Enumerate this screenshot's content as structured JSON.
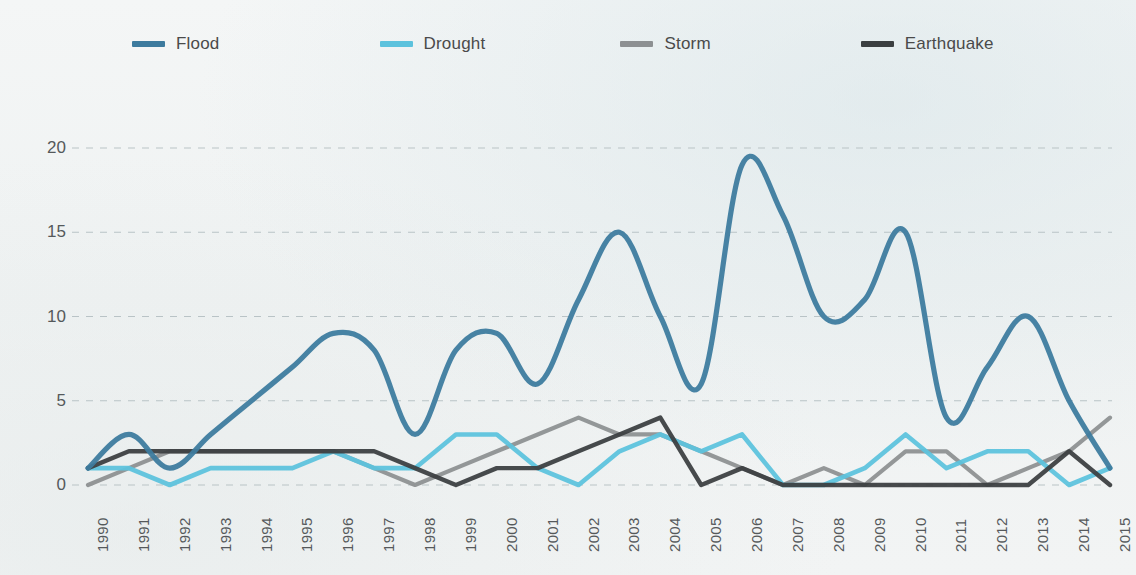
{
  "legend": {
    "position": "top-left",
    "items": [
      {
        "label": "Flood",
        "color": "#3d7b9e",
        "icon": "line-swatch"
      },
      {
        "label": "Drought",
        "color": "#5cc2dd",
        "icon": "line-swatch"
      },
      {
        "label": "Storm",
        "color": "#8d9092",
        "icon": "line-swatch"
      },
      {
        "label": "Earthquake",
        "color": "#3b3f41",
        "icon": "line-swatch"
      }
    ]
  },
  "axes": {
    "y_ticks": [
      "0",
      "5",
      "10",
      "15",
      "20"
    ],
    "x_ticks": [
      "1990",
      "1991",
      "1992",
      "1993",
      "1994",
      "1995",
      "1996",
      "1997",
      "1998",
      "1999",
      "2000",
      "2001",
      "2002",
      "2003",
      "2004",
      "2005",
      "2006",
      "2007",
      "2008",
      "2009",
      "2010",
      "2011",
      "2012",
      "2013",
      "2014",
      "2015"
    ]
  },
  "style": {
    "background": "#f1f4f4",
    "gridline_color": "#b9c3c6",
    "tick_text_color": "#55595b"
  },
  "chart_data": {
    "type": "line",
    "title": "",
    "subtitle": "",
    "xlabel": "",
    "ylabel": "",
    "xlim": [
      1990,
      2015
    ],
    "ylim": [
      0,
      21
    ],
    "y_ticks": [
      0,
      5,
      10,
      15,
      20
    ],
    "grid": "horizontal-dashed",
    "legend_position": "top-left",
    "smoothing": "spline",
    "x": [
      1990,
      1991,
      1992,
      1993,
      1994,
      1995,
      1996,
      1997,
      1998,
      1999,
      2000,
      2001,
      2002,
      2003,
      2004,
      2005,
      2006,
      2007,
      2008,
      2009,
      2010,
      2011,
      2012,
      2013,
      2014,
      2015
    ],
    "series": [
      {
        "name": "Flood",
        "color": "#3d7b9e",
        "values": [
          1,
          3,
          1,
          3,
          5,
          7,
          9,
          8,
          3,
          8,
          9,
          6,
          11,
          15,
          10,
          6,
          19,
          16,
          10,
          11,
          15,
          4,
          7,
          10,
          5,
          1
        ]
      },
      {
        "name": "Drought",
        "color": "#5cc2dd",
        "values": [
          1,
          1,
          0,
          1,
          1,
          1,
          2,
          1,
          1,
          3,
          3,
          1,
          0,
          2,
          3,
          2,
          3,
          0,
          0,
          1,
          3,
          1,
          2,
          2,
          0,
          1
        ]
      },
      {
        "name": "Storm",
        "color": "#8d9092",
        "values": [
          0,
          1,
          2,
          2,
          2,
          2,
          2,
          1,
          0,
          1,
          2,
          3,
          4,
          3,
          3,
          2,
          1,
          0,
          1,
          0,
          2,
          2,
          0,
          1,
          2,
          4
        ]
      },
      {
        "name": "Earthquake",
        "color": "#3b3f41",
        "values": [
          1,
          2,
          2,
          2,
          2,
          2,
          2,
          2,
          1,
          0,
          1,
          1,
          2,
          3,
          4,
          0,
          1,
          0,
          0,
          0,
          0,
          0,
          0,
          0,
          2,
          0
        ]
      }
    ]
  }
}
